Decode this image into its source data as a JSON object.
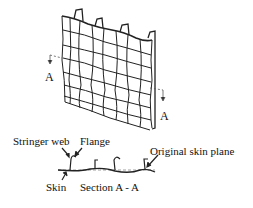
{
  "diagram": {
    "type": "engineering-illustration",
    "labels": {
      "section_marker_left": "A",
      "section_marker_right": "A",
      "stringer_web": "Stringer web",
      "flange": "Flange",
      "original_skin_plane": "Original skin plane",
      "skin": "Skin",
      "section_title": "Section A - A"
    },
    "colors": {
      "line": "#222222",
      "dashed": "#777777",
      "background": "#ffffff"
    }
  }
}
